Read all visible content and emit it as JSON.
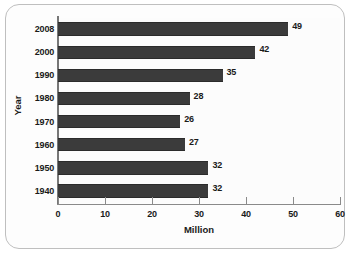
{
  "chart_data": {
    "type": "bar",
    "orientation": "horizontal",
    "title": "",
    "xlabel": "Million",
    "ylabel": "Year",
    "categories": [
      "2008",
      "2000",
      "1990",
      "1980",
      "1970",
      "1960",
      "1950",
      "1940"
    ],
    "values": [
      49,
      42,
      35,
      28,
      26,
      27,
      32,
      32
    ],
    "value_labels": [
      "49",
      "42",
      "35",
      "28",
      "26",
      "27",
      "32",
      "32"
    ],
    "xlim": [
      0,
      60
    ],
    "xticks": [
      0,
      10,
      20,
      30,
      40,
      50,
      60
    ],
    "xtick_labels": [
      "0",
      "10",
      "20",
      "30",
      "40",
      "50",
      "60"
    ],
    "grid": false,
    "legend": null,
    "bar_color": "#3b3b3b",
    "axis_color": "#8a8a8a",
    "plot_background": "#fcfcfc",
    "frame_border_color": "#bfbfbf"
  }
}
